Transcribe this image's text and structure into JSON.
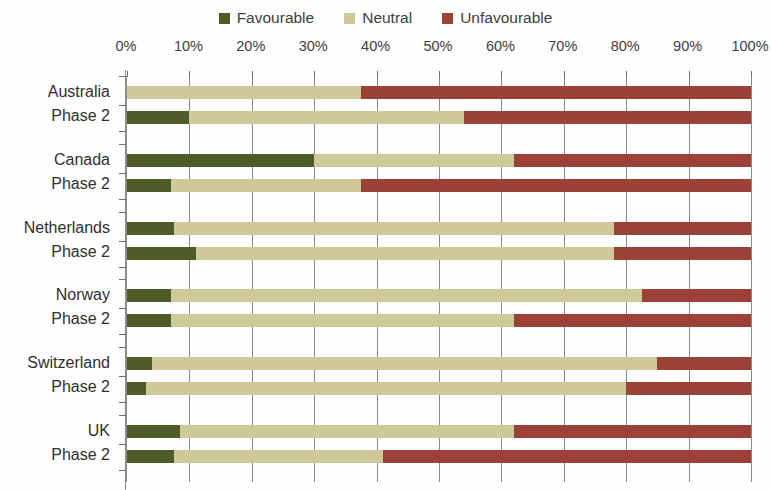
{
  "legend": {
    "items": [
      {
        "label": "Favourable",
        "color": "#4e5b29"
      },
      {
        "label": "Neutral",
        "color": "#cfc99a"
      },
      {
        "label": "Unfavourable",
        "color": "#9c4136"
      }
    ]
  },
  "axis": {
    "tick_labels": [
      "0%",
      "10%",
      "20%",
      "30%",
      "40%",
      "50%",
      "60%",
      "70%",
      "80%",
      "90%",
      "100%"
    ]
  },
  "categories": [
    {
      "line1": "Australia",
      "line2": "Phase 2"
    },
    {
      "line1": "Canada",
      "line2": "Phase 2"
    },
    {
      "line1": "Netherlands",
      "line2": "Phase 2"
    },
    {
      "line1": "Norway",
      "line2": "Phase 2"
    },
    {
      "line1": "Switzerland",
      "line2": "Phase 2"
    },
    {
      "line1": "UK",
      "line2": "Phase 2"
    }
  ],
  "chart_data": {
    "type": "bar",
    "title": "",
    "xlabel": "",
    "ylabel": "",
    "orientation": "horizontal",
    "stacked": true,
    "stack_total": 100,
    "xlim": [
      0,
      100
    ],
    "xticks": [
      0,
      10,
      20,
      30,
      40,
      50,
      60,
      70,
      80,
      90,
      100
    ],
    "xtick_labels": [
      "0%",
      "10%",
      "20%",
      "30%",
      "40%",
      "50%",
      "60%",
      "70%",
      "80%",
      "90%",
      "100%"
    ],
    "grid": true,
    "legend_position": "top-center",
    "categories": [
      "Australia",
      "Australia Phase 2",
      "Canada",
      "Canada Phase 2",
      "Netherlands",
      "Netherlands Phase 2",
      "Norway",
      "Norway Phase 2",
      "Switzerland",
      "Switzerland Phase 2",
      "UK",
      "UK Phase 2"
    ],
    "series": [
      {
        "name": "Favourable",
        "color": "#4e5b29",
        "values": [
          0,
          10,
          30,
          7,
          7.5,
          11,
          7,
          7,
          4,
          3,
          8.5,
          7.5
        ]
      },
      {
        "name": "Neutral",
        "color": "#cfc99a",
        "values": [
          37.5,
          44,
          32,
          30.5,
          70.5,
          67,
          75.5,
          55,
          81,
          77,
          53.5,
          33.5
        ]
      },
      {
        "name": "Unfavourable",
        "color": "#9c4136",
        "values": [
          62.5,
          46,
          38,
          62.5,
          22,
          22,
          17.5,
          38,
          15,
          20,
          38,
          59
        ]
      }
    ]
  }
}
